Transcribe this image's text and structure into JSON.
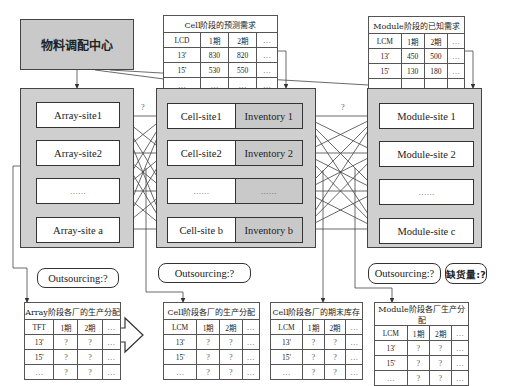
{
  "center": {
    "label": "物料调配中心"
  },
  "array_panel": {
    "sites": [
      "Array-site1",
      "Array-site2",
      "……",
      "Array-site a"
    ]
  },
  "cell_panel": {
    "sites": [
      {
        "site": "Cell-site1",
        "inventory": "Inventory 1"
      },
      {
        "site": "Cell-site2",
        "inventory": "Inventory 2"
      },
      {
        "site": "……",
        "inventory": "……"
      },
      {
        "site": "Cell-site b",
        "inventory": "Inventory b"
      }
    ]
  },
  "module_panel": {
    "sites": [
      "Module-site 1",
      "Module-site 2",
      "……",
      "Module-site c"
    ]
  },
  "question_marks": {
    "array_to_cell": "?",
    "cell_to_module": "?"
  },
  "outsourcing": {
    "array": "Outsourcing:?",
    "cell": "Outsourcing:?",
    "module": "Outsourcing:?",
    "shortage": "缺货量:?"
  },
  "tables": {
    "cell_forecast": {
      "title": "Cell阶段的预测需求",
      "header": [
        "LCD",
        "1期",
        "2期",
        "…"
      ],
      "rows": [
        [
          "13'",
          "830",
          "820",
          "…"
        ],
        [
          "15'",
          "530",
          "550",
          "…"
        ],
        [
          "…",
          "…",
          "…",
          "…"
        ]
      ]
    },
    "module_known": {
      "title": "Module阶段的已知需求",
      "header": [
        "LCM",
        "1期",
        "2期",
        "…"
      ],
      "rows": [
        [
          "13'",
          "450",
          "500",
          "…"
        ],
        [
          "15'",
          "130",
          "180",
          "…"
        ],
        [
          "…",
          "…",
          "…",
          "…"
        ]
      ]
    },
    "array_alloc": {
      "title": "Array阶段各厂的生产分配",
      "header": [
        "TFT",
        "1期",
        "2期",
        "…"
      ],
      "rows": [
        [
          "13'",
          "?",
          "?",
          "…"
        ],
        [
          "15'",
          "?",
          "?",
          "…"
        ],
        [
          "…",
          "?",
          "?",
          "…"
        ]
      ]
    },
    "cell_alloc": {
      "title": "Cell阶段各厂的生产分配",
      "header": [
        "LCM",
        "1期",
        "2期",
        "…"
      ],
      "rows": [
        [
          "13'",
          "?",
          "?",
          "…"
        ],
        [
          "15'",
          "?",
          "?",
          "…"
        ],
        [
          "…",
          "?",
          "?",
          "…"
        ]
      ]
    },
    "cell_inventory": {
      "title": "Cell阶段各厂的期末库存",
      "header": [
        "LCM",
        "1期",
        "2期",
        "…"
      ],
      "rows": [
        [
          "13'",
          "?",
          "?",
          "…"
        ],
        [
          "15'",
          "?",
          "?",
          "…"
        ],
        [
          "…",
          "?",
          "?",
          "…"
        ]
      ]
    },
    "module_alloc": {
      "title": "Module阶段各厂生产分配",
      "header": [
        "LCM",
        "1期",
        "2期",
        "…"
      ],
      "rows": [
        [
          "13'",
          "?",
          "?",
          "…"
        ],
        [
          "15'",
          "?",
          "?",
          "…"
        ],
        [
          "…",
          "?",
          "?",
          "…"
        ]
      ]
    }
  }
}
